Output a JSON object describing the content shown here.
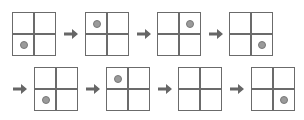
{
  "diagram": {
    "colors": {
      "grid_line": "#6b6b6b",
      "dot_fill": "#9a9a9a",
      "dot_stroke": "#787878",
      "arrow": "#666666",
      "background": "#ffffff"
    },
    "rows": [
      {
        "leading_arrow": false,
        "steps": [
          {
            "index": 1,
            "dot": "bottom-left"
          },
          {
            "index": 2,
            "dot": "top-left"
          },
          {
            "index": 3,
            "dot": "top-right"
          },
          {
            "index": 4,
            "dot": "bottom-right"
          }
        ]
      },
      {
        "leading_arrow": true,
        "steps": [
          {
            "index": 5,
            "dot": "bottom-left"
          },
          {
            "index": 6,
            "dot": "top-left"
          },
          {
            "index": 7,
            "dot": "none"
          },
          {
            "index": 8,
            "dot": "bottom-right"
          }
        ]
      }
    ],
    "arrow_icon": "right-arrow-icon"
  }
}
